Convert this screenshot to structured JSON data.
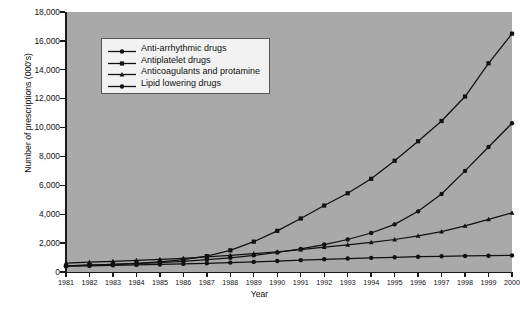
{
  "chart_data": {
    "type": "line",
    "title": "",
    "xlabel": "Year",
    "ylabel": "Number of prescriptions (000's)",
    "xlim": [
      1981,
      2000
    ],
    "ylim": [
      0,
      18000
    ],
    "ytick_step": 2000,
    "grid": false,
    "legend_position": "upper-left-inside",
    "x": [
      1981,
      1982,
      1983,
      1984,
      1985,
      1986,
      1987,
      1988,
      1989,
      1990,
      1991,
      1992,
      1993,
      1994,
      1995,
      1996,
      1997,
      1998,
      1999,
      2000
    ],
    "xtick_labels": [
      "1981",
      "1982",
      "1983",
      "1984",
      "1985",
      "1986",
      "1987",
      "1988",
      "1989",
      "1990",
      "1991",
      "1992",
      "1993",
      "1994",
      "1995",
      "1996",
      "1997",
      "1998",
      "1999",
      "2000"
    ],
    "ytick_labels": [
      "0",
      "2,000",
      "4,000",
      "6,000",
      "8,000",
      "10,000",
      "12,000",
      "14,000",
      "16,000",
      "18,000"
    ],
    "ytick_values": [
      0,
      2000,
      4000,
      6000,
      8000,
      10000,
      12000,
      14000,
      16000,
      18000
    ],
    "series": [
      {
        "name": "Anti-arrhythmic drugs",
        "marker": "circle",
        "color": "#111111",
        "values": [
          400,
          430,
          460,
          490,
          520,
          560,
          600,
          650,
          700,
          760,
          820,
          880,
          930,
          980,
          1020,
          1060,
          1090,
          1110,
          1130,
          1150
        ]
      },
      {
        "name": "Antiplatelet drugs",
        "marker": "square",
        "color": "#111111",
        "values": [
          420,
          470,
          530,
          600,
          700,
          850,
          1100,
          1500,
          2100,
          2850,
          3700,
          4600,
          5450,
          6450,
          7700,
          9050,
          10450,
          12150,
          14450,
          16500
        ]
      },
      {
        "name": "Anticoagulants and protamine",
        "marker": "triangle",
        "color": "#111111",
        "values": [
          620,
          680,
          740,
          800,
          870,
          950,
          1050,
          1150,
          1270,
          1400,
          1550,
          1720,
          1880,
          2050,
          2250,
          2500,
          2800,
          3200,
          3650,
          4100
        ]
      },
      {
        "name": "Lipid lowering drugs",
        "marker": "circle",
        "color": "#111111",
        "values": [
          430,
          470,
          520,
          580,
          650,
          740,
          850,
          980,
          1150,
          1350,
          1600,
          1900,
          2250,
          2700,
          3300,
          4200,
          5400,
          7000,
          8650,
          10300
        ]
      }
    ]
  },
  "legend": {
    "items": [
      {
        "label": "Anti-arrhythmic drugs",
        "marker": "circle"
      },
      {
        "label": "Antiplatelet drugs",
        "marker": "square"
      },
      {
        "label": "Anticoagulants and protamine",
        "marker": "triangle"
      },
      {
        "label": "Lipid lowering drugs",
        "marker": "circle"
      }
    ]
  },
  "caption": ""
}
